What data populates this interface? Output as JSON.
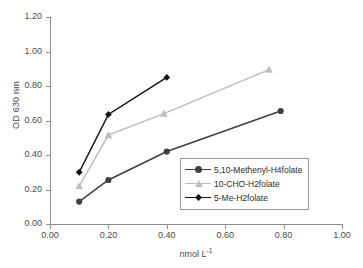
{
  "chart_data": {
    "type": "line",
    "title": "",
    "xlabel": "nmol L-1",
    "xlabel_base": "nmol L",
    "xlabel_exponent": "-1",
    "ylabel": "OD 630 nm",
    "xlim": [
      0.0,
      1.0
    ],
    "ylim": [
      0.0,
      1.2
    ],
    "xticks": [
      "0.00",
      "0.20",
      "0.40",
      "0.60",
      "0.80",
      "1.00"
    ],
    "yticks": [
      "0.00",
      "0.20",
      "0.40",
      "0.60",
      "0.80",
      "1.00",
      "1.20"
    ],
    "grid": false,
    "legend_position": "inside-lower-right",
    "series": [
      {
        "name": "5,10-Methenyl-H4folate",
        "color": "#3f3f3f",
        "marker": "circle",
        "x": [
          0.1,
          0.2,
          0.4,
          0.79
        ],
        "y": [
          0.13,
          0.255,
          0.42,
          0.655
        ]
      },
      {
        "name": "10-CHO-H2folate",
        "color": "#bdbdbd",
        "marker": "triangle",
        "x": [
          0.1,
          0.2,
          0.39,
          0.75
        ],
        "y": [
          0.22,
          0.515,
          0.64,
          0.895
        ]
      },
      {
        "name": "5-Me-H2folate",
        "color": "#121212",
        "marker": "diamond",
        "x": [
          0.1,
          0.2,
          0.4
        ],
        "y": [
          0.3,
          0.635,
          0.85
        ]
      }
    ]
  },
  "axes": {
    "y_title": "OD 630 nm"
  }
}
